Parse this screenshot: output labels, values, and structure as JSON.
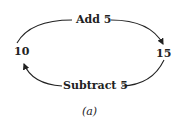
{
  "diagram": {
    "nodes": [
      {
        "id": "n10",
        "label": "10"
      },
      {
        "id": "n15",
        "label": "15"
      }
    ],
    "edges": [
      {
        "from": "n10",
        "to": "n15",
        "label": "Add 5"
      },
      {
        "from": "n15",
        "to": "n10",
        "label": "Subtract 5"
      }
    ],
    "caption": "(a)"
  },
  "colors": {
    "stroke": "#222222",
    "background": "#ffffff"
  }
}
